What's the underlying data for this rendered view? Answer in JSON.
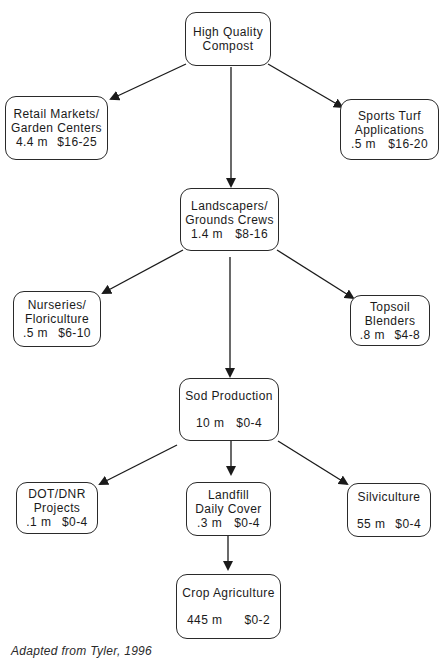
{
  "diagram": {
    "line_color": "#1a1a1a",
    "nodes": {
      "compost": {
        "title": "High Quality\nCompost"
      },
      "retail": {
        "title": "Retail Markets/\nGarden Centers",
        "volume": "4.4 m",
        "price": "$16-25"
      },
      "sports_turf": {
        "title": "Sports Turf\nApplications",
        "volume": ".5 m",
        "price": "$16-20"
      },
      "landscapers": {
        "title": "Landscapers/\nGrounds Crews",
        "volume": "1.4 m",
        "price": "$8-16"
      },
      "nurseries": {
        "title": "Nurseries/\nFloriculture",
        "volume": ".5 m",
        "price": "$6-10"
      },
      "topsoil": {
        "title": "Topsoil\nBlenders",
        "volume": ".8 m",
        "price": "$4-8"
      },
      "sod": {
        "title": "Sod Production",
        "volume": "10 m",
        "price": "$0-4"
      },
      "dot_dnr": {
        "title": "DOT/DNR\nProjects",
        "volume": ".1 m",
        "price": "$0-4"
      },
      "landfill": {
        "title": "Landfill\nDaily Cover",
        "volume": ".3 m",
        "price": "$0-4"
      },
      "silviculture": {
        "title": "Silviculture",
        "volume": "55 m",
        "price": "$0-4"
      },
      "crop": {
        "title": "Crop Agriculture",
        "volume": "445 m",
        "price": "$0-2"
      }
    },
    "edges": [
      {
        "from": "compost",
        "to": "retail"
      },
      {
        "from": "compost",
        "to": "landscapers"
      },
      {
        "from": "compost",
        "to": "sports_turf"
      },
      {
        "from": "landscapers",
        "to": "nurseries"
      },
      {
        "from": "landscapers",
        "to": "sod"
      },
      {
        "from": "landscapers",
        "to": "topsoil"
      },
      {
        "from": "sod",
        "to": "dot_dnr"
      },
      {
        "from": "sod",
        "to": "landfill"
      },
      {
        "from": "sod",
        "to": "silviculture"
      },
      {
        "from": "landfill",
        "to": "crop"
      }
    ],
    "caption": "Adapted from Tyler, 1996"
  }
}
